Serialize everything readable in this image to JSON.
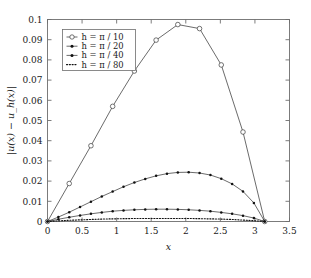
{
  "chart_data": {
    "type": "line",
    "title": "",
    "xlabel": "x",
    "ylabel": "|u(x) − u_h(x)|",
    "xlim": [
      0,
      3.5
    ],
    "ylim": [
      0,
      0.1
    ],
    "xticks": [
      0,
      0.5,
      1,
      1.5,
      2,
      2.5,
      3,
      3.5
    ],
    "xtick_labels": [
      "0",
      "0.5",
      "1",
      "1.5",
      "2",
      "2.5",
      "3",
      "3.5"
    ],
    "yticks": [
      0,
      0.01,
      0.02,
      0.03,
      0.04,
      0.05,
      0.06,
      0.07,
      0.08,
      0.09,
      0.1
    ],
    "ytick_labels": [
      "0",
      "0.01",
      "0.02",
      "0.03",
      "0.04",
      "0.05",
      "0.06",
      "0.07",
      "0.08",
      "0.09",
      "0.1"
    ],
    "grid": false,
    "legend_position": "upper-left",
    "series": [
      {
        "name": "h = π / 10",
        "marker": "circle-open",
        "linestyle": "solid",
        "color": "#3a3a3a",
        "x": [
          0,
          0.3142,
          0.6283,
          0.9425,
          1.2566,
          1.5708,
          1.885,
          2.1991,
          2.5133,
          2.8274,
          3.1416
        ],
        "y": [
          0,
          0.0188,
          0.0375,
          0.057,
          0.0745,
          0.0898,
          0.0975,
          0.0955,
          0.0775,
          0.0443,
          0
        ]
      },
      {
        "name": "h = π / 20",
        "marker": "dot-filled",
        "linestyle": "solid",
        "color": "#111111",
        "x": [
          0,
          0.1571,
          0.3142,
          0.4712,
          0.6283,
          0.7854,
          0.9425,
          1.0996,
          1.2566,
          1.4137,
          1.5708,
          1.7279,
          1.885,
          2.042,
          2.1991,
          2.3562,
          2.5133,
          2.6704,
          2.8274,
          2.9845,
          3.1416
        ],
        "y": [
          0,
          0.0022,
          0.0046,
          0.0072,
          0.0098,
          0.0124,
          0.0148,
          0.0172,
          0.0193,
          0.0211,
          0.0226,
          0.0237,
          0.0243,
          0.0244,
          0.024,
          0.023,
          0.0212,
          0.0186,
          0.0149,
          0.0092,
          0
        ]
      },
      {
        "name": "h = π / 40",
        "marker": "dot-filled",
        "linestyle": "solid",
        "color": "#111111",
        "x": [
          0,
          0.1571,
          0.3142,
          0.4712,
          0.6283,
          0.7854,
          0.9425,
          1.0996,
          1.2566,
          1.4137,
          1.5708,
          1.7279,
          1.885,
          2.042,
          2.1991,
          2.3562,
          2.5133,
          2.6704,
          2.8274,
          2.9845,
          3.1416
        ],
        "y": [
          0,
          0.0011,
          0.0021,
          0.003,
          0.0038,
          0.0045,
          0.0051,
          0.0055,
          0.0058,
          0.006,
          0.0061,
          0.0061,
          0.006,
          0.0058,
          0.0055,
          0.0051,
          0.0045,
          0.0038,
          0.0029,
          0.0017,
          0
        ]
      },
      {
        "name": "h = π / 80",
        "marker": "none",
        "linestyle": "dotted",
        "color": "#111111",
        "x": [
          0,
          0.1571,
          0.3142,
          0.4712,
          0.6283,
          0.7854,
          0.9425,
          1.0996,
          1.2566,
          1.4137,
          1.5708,
          1.7279,
          1.885,
          2.042,
          2.1991,
          2.3562,
          2.5133,
          2.6704,
          2.8274,
          2.9845,
          3.1416
        ],
        "y": [
          0,
          0.0003,
          0.0006,
          0.0008,
          0.001,
          0.0012,
          0.0013,
          0.0014,
          0.0015,
          0.0015,
          0.0015,
          0.0015,
          0.0015,
          0.0015,
          0.0014,
          0.0013,
          0.0012,
          0.001,
          0.0007,
          0.0004,
          0
        ]
      }
    ]
  },
  "legend": {
    "entries": [
      {
        "label": "h = π / 10"
      },
      {
        "label": "h = π / 20"
      },
      {
        "label": "h = π / 40"
      },
      {
        "label": "h = π / 80"
      }
    ]
  }
}
